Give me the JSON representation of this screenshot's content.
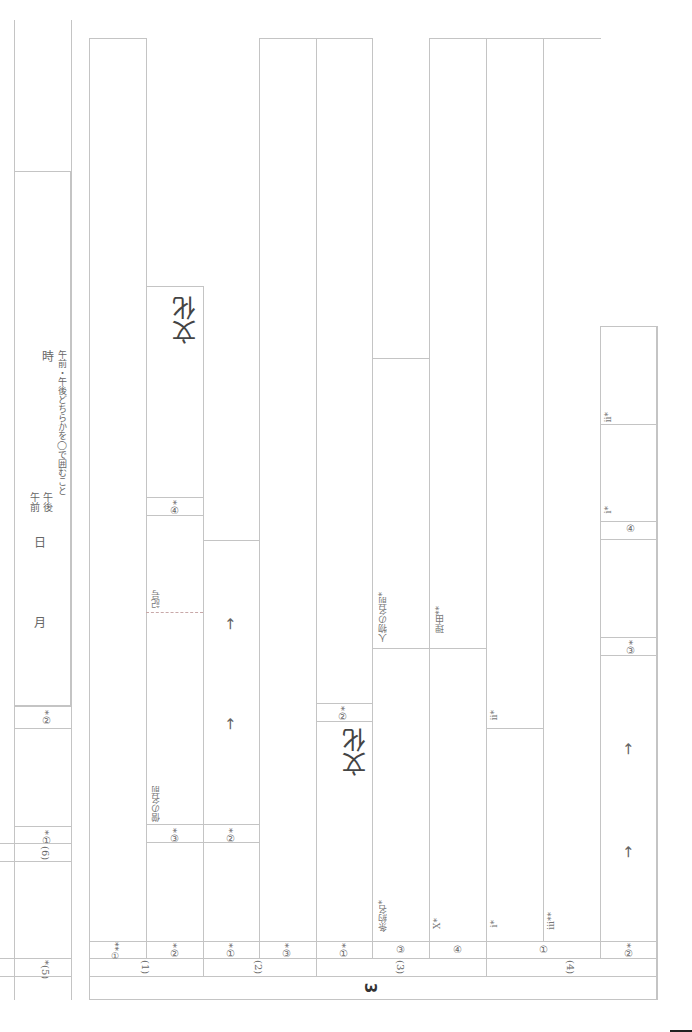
{
  "sheet": {
    "section_number": "3",
    "left_panel": {
      "item_6_label": "(6)",
      "item_6_1_label": "*①",
      "item_6_2_label": "*②",
      "item_5_label": "*(5)",
      "month": "月",
      "day": "日",
      "am": "午前",
      "pm": "午後",
      "hour": "時",
      "instruction": "午前・午後どちらかを◯で囲むこと"
    },
    "groups": [
      {
        "label": "(1)",
        "items": [
          {
            "label": "**①"
          },
          {
            "label": "*②",
            "sub": [
              {
                "label": "*③",
                "caption": "僧の名前"
              },
              {
                "label": "*④",
                "caption": "記号",
                "answer": "文化"
              }
            ]
          }
        ]
      },
      {
        "label": "(2)",
        "items": [
          {
            "label": "*①",
            "sub": [
              {
                "label": "*②",
                "arrows": [
                  "→",
                  "→"
                ]
              }
            ]
          },
          {
            "label": "*③"
          }
        ]
      },
      {
        "label": "(3)",
        "items": [
          {
            "label": "*①",
            "sub": [
              {
                "label": "*②",
                "answer": "文化"
              }
            ]
          },
          {
            "label": "③",
            "caption": "条約名*",
            "sub_caption": "人物の名前*"
          },
          {
            "label": "④",
            "caption": "X*",
            "sub_caption": "理由**"
          }
        ]
      },
      {
        "label": "(4)",
        "items": [
          {
            "label": "①",
            "captions": [
              "i*",
              "ii*",
              "iii**"
            ]
          },
          {
            "label": "*②",
            "arrows": [
              "→",
              "→"
            ],
            "sub": [
              {
                "label": "*③"
              },
              {
                "label": "④",
                "captions": [
                  "i*",
                  "ii*"
                ]
              }
            ]
          }
        ]
      }
    ]
  }
}
